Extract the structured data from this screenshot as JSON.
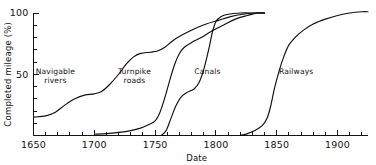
{
  "chart_data": {
    "type": "line",
    "title": "",
    "xlabel": "Date",
    "ylabel": "Completed mileage (%)",
    "xlim": [
      1650,
      1925
    ],
    "ylim": [
      0,
      100
    ],
    "grid": false,
    "legend": "inline-curve-labels",
    "x_ticks_major": [
      1650,
      1700,
      1750,
      1800,
      1850,
      1900
    ],
    "x_ticks_major_labels": [
      "1650",
      "1700",
      "1750",
      "1800",
      "1850",
      "1900"
    ],
    "x_tick_minor_step": 10,
    "y_ticks_major": [
      50,
      100
    ],
    "y_ticks_major_labels": [
      "50",
      "100"
    ],
    "y_tick_minor_step": 10,
    "series": [
      {
        "name": "Navigable rivers",
        "label": "Navigable",
        "label_line2": "rivers",
        "points": [
          [
            1650,
            15
          ],
          [
            1660,
            16
          ],
          [
            1668,
            19
          ],
          [
            1676,
            25
          ],
          [
            1684,
            30
          ],
          [
            1692,
            33
          ],
          [
            1700,
            34
          ],
          [
            1706,
            36
          ],
          [
            1712,
            41
          ],
          [
            1720,
            50
          ],
          [
            1726,
            58
          ],
          [
            1732,
            64
          ],
          [
            1738,
            67
          ],
          [
            1746,
            68
          ],
          [
            1752,
            69
          ],
          [
            1758,
            72
          ],
          [
            1764,
            77
          ],
          [
            1772,
            82
          ],
          [
            1782,
            87
          ],
          [
            1792,
            91
          ],
          [
            1802,
            94
          ],
          [
            1812,
            97
          ],
          [
            1822,
            99
          ],
          [
            1832,
            100
          ],
          [
            1840,
            100
          ]
        ]
      },
      {
        "name": "Turnpike roads",
        "label": "Turnpike",
        "label_line2": "roads",
        "points": [
          [
            1700,
            1
          ],
          [
            1710,
            1.5
          ],
          [
            1720,
            2.5
          ],
          [
            1730,
            4
          ],
          [
            1738,
            6
          ],
          [
            1744,
            8.5
          ],
          [
            1750,
            12
          ],
          [
            1754,
            19
          ],
          [
            1758,
            31
          ],
          [
            1762,
            45
          ],
          [
            1766,
            58
          ],
          [
            1770,
            67
          ],
          [
            1774,
            72
          ],
          [
            1780,
            76
          ],
          [
            1788,
            80
          ],
          [
            1796,
            85
          ],
          [
            1806,
            90
          ],
          [
            1816,
            95
          ],
          [
            1826,
            98
          ],
          [
            1834,
            100
          ],
          [
            1840,
            100
          ]
        ]
      },
      {
        "name": "Canals",
        "label": "Canals",
        "label_line2": "",
        "points": [
          [
            1755,
            0
          ],
          [
            1759,
            4
          ],
          [
            1763,
            14
          ],
          [
            1767,
            24
          ],
          [
            1771,
            31
          ],
          [
            1776,
            35
          ],
          [
            1782,
            38
          ],
          [
            1786,
            43
          ],
          [
            1790,
            54
          ],
          [
            1794,
            70
          ],
          [
            1797,
            84
          ],
          [
            1800,
            93
          ],
          [
            1804,
            97
          ],
          [
            1810,
            99
          ],
          [
            1820,
            100
          ],
          [
            1832,
            100
          ],
          [
            1840,
            100
          ]
        ]
      },
      {
        "name": "Railways",
        "label": "Railways",
        "label_line2": "",
        "points": [
          [
            1820,
            0
          ],
          [
            1826,
            1.5
          ],
          [
            1832,
            4
          ],
          [
            1838,
            8
          ],
          [
            1842,
            14
          ],
          [
            1845,
            24
          ],
          [
            1848,
            38
          ],
          [
            1852,
            53
          ],
          [
            1856,
            65
          ],
          [
            1860,
            74
          ],
          [
            1865,
            80
          ],
          [
            1872,
            86
          ],
          [
            1880,
            91
          ],
          [
            1890,
            95
          ],
          [
            1900,
            98
          ],
          [
            1910,
            100
          ],
          [
            1920,
            101
          ],
          [
            1925,
            101
          ]
        ]
      }
    ],
    "annotations": [
      {
        "text": "Navigable",
        "x": 1668,
        "y": 50
      },
      {
        "text": "rivers",
        "x": 1668,
        "y": 43
      },
      {
        "text": "Turnpike",
        "x": 1733,
        "y": 50
      },
      {
        "text": "roads",
        "x": 1733,
        "y": 43
      },
      {
        "text": "Canals",
        "x": 1793,
        "y": 50
      },
      {
        "text": "Railways",
        "x": 1866,
        "y": 50
      }
    ]
  }
}
